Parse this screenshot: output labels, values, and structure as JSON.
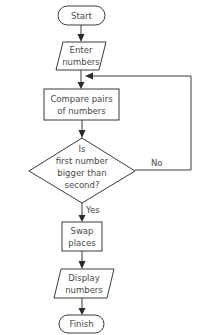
{
  "diagram": {
    "type": "flowchart",
    "nodes": [
      {
        "id": "start",
        "shape": "terminal",
        "lines": [
          "Start"
        ]
      },
      {
        "id": "enter",
        "shape": "input-output",
        "lines": [
          "Enter",
          "numbers"
        ]
      },
      {
        "id": "compare",
        "shape": "process",
        "lines": [
          "Compare pairs",
          "of numbers"
        ]
      },
      {
        "id": "decision",
        "shape": "decision",
        "lines": [
          "Is",
          "first number",
          "bigger than",
          "second?"
        ]
      },
      {
        "id": "swap",
        "shape": "process",
        "lines": [
          "Swap",
          "places"
        ]
      },
      {
        "id": "display",
        "shape": "input-output",
        "lines": [
          "Display",
          "numbers"
        ]
      },
      {
        "id": "finish",
        "shape": "terminal",
        "lines": [
          "Finish"
        ]
      }
    ],
    "edges": [
      {
        "from": "start",
        "to": "enter",
        "label": ""
      },
      {
        "from": "enter",
        "to": "compare",
        "label": ""
      },
      {
        "from": "compare",
        "to": "decision",
        "label": ""
      },
      {
        "from": "decision",
        "to": "swap",
        "label": "Yes"
      },
      {
        "from": "decision",
        "to": "compare",
        "label": "No"
      },
      {
        "from": "swap",
        "to": "display",
        "label": ""
      },
      {
        "from": "display",
        "to": "finish",
        "label": ""
      }
    ],
    "edge_labels": {
      "yes": "Yes",
      "no": "No"
    },
    "colors": {
      "stroke": "#3a3a3a",
      "text": "#4a4a4a",
      "background": "#ffffff"
    }
  }
}
